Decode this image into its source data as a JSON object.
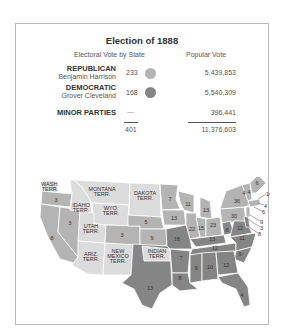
{
  "title": "Election of 1888",
  "headers": {
    "electoral": "Electoral Vote by State",
    "popular": "Popular Vote"
  },
  "parties": [
    {
      "name": "REPUBLICAN",
      "candidate": "Benjamin Harrison",
      "electoral": "233",
      "popular": "5,439,853",
      "color": "#b4b4b4"
    },
    {
      "name": "DEMOCRATIC",
      "candidate": "Grover Cleveland",
      "electoral": "168",
      "popular": "5,540,309",
      "color": "#858585"
    },
    {
      "name": "MINOR PARTIES",
      "candidate": "",
      "electoral": "—",
      "popular": "396,441",
      "color": ""
    }
  ],
  "totals": {
    "electoral": "401",
    "popular": "11,376,603"
  },
  "colors": {
    "republican": "#b4b4b4",
    "democratic": "#858585",
    "territory": "#dcdcdc",
    "border": "#ffffff",
    "frame": "#b8b8b8"
  },
  "map": {
    "territories": [
      "WASH. TERR.",
      "MONTANA TERR.",
      "DAKOTA TERR.",
      "IDAHO TERR.",
      "WYO. TERR.",
      "UTAH TERR.",
      "ARIZ. TERR.",
      "NEW MEXICO TERR.",
      "INDIAN TERR."
    ],
    "state_votes": {
      "oregon": "3",
      "nevada": "3",
      "california": "8",
      "colorado": "3",
      "nebraska": "5",
      "kansas": "9",
      "minnesota": "7",
      "iowa": "13",
      "wisconsin": "11",
      "michigan": "13",
      "illinois": "22",
      "indiana": "15",
      "ohio": "23",
      "pennsylvania": "30",
      "new_york": "36",
      "maine": "6",
      "vermont": "4",
      "new_hampshire": "4",
      "massachusetts": "14",
      "rhode_island": "4",
      "connecticut": "6",
      "new_jersey": "9",
      "delaware": "3",
      "maryland": "8",
      "missouri": "16",
      "kentucky": "13",
      "west_virginia": "6",
      "virginia": "12",
      "tennessee": "12",
      "north_carolina": "11",
      "arkansas": "7",
      "texas": "13",
      "louisiana": "8",
      "mississippi": "9",
      "alabama": "10",
      "georgia": "12",
      "south_carolina": "9",
      "florida": "4"
    }
  }
}
